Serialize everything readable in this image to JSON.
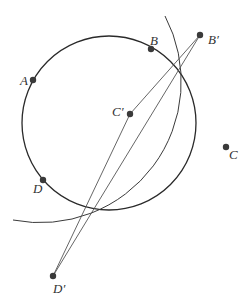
{
  "diagram": {
    "width": 252,
    "height": 305,
    "colors": {
      "background": "#ffffff",
      "stroke": "#2a2a2a",
      "line": "#555555",
      "point": "#3a3a3a",
      "label": "#333333"
    },
    "circle": {
      "cx": 109,
      "cy": 123,
      "r": 87
    },
    "arc": {
      "center_point": "A",
      "cx": 33,
      "cy": 80,
      "r": 141,
      "start": [
        165,
        16
      ],
      "end": [
        13,
        220
      ]
    },
    "points": [
      {
        "id": "A",
        "label": "A",
        "x": 33,
        "y": 80,
        "lx": 20,
        "ly": 85
      },
      {
        "id": "B",
        "label": "B",
        "x": 151,
        "y": 49,
        "lx": 150,
        "ly": 45
      },
      {
        "id": "B'",
        "label": "B′",
        "x": 200,
        "y": 35,
        "lx": 208,
        "ly": 44
      },
      {
        "id": "C'",
        "label": "C′",
        "x": 130,
        "y": 114,
        "lx": 112,
        "ly": 116
      },
      {
        "id": "C",
        "label": "C",
        "x": 226,
        "y": 147,
        "lx": 229,
        "ly": 159
      },
      {
        "id": "D",
        "label": "D",
        "x": 43,
        "y": 180,
        "lx": 33,
        "ly": 193
      },
      {
        "id": "D'",
        "label": "D′",
        "x": 53,
        "y": 276,
        "lx": 53,
        "ly": 293
      }
    ],
    "segments": [
      {
        "from": "B'",
        "to": "C'"
      },
      {
        "from": "C'",
        "to": "D'"
      },
      {
        "from": "B'",
        "to": "D'"
      }
    ]
  }
}
